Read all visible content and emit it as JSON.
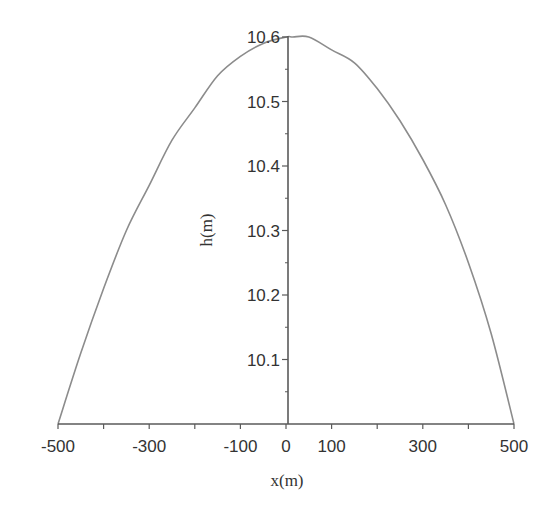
{
  "chart_data": {
    "type": "line",
    "title": "",
    "xlabel": "x(m)",
    "ylabel": "h(m)",
    "xlim": [
      -500,
      500
    ],
    "ylim": [
      10.0,
      10.6
    ],
    "grid": false,
    "legend": null,
    "x_ticks_major_labeled": [
      -500,
      -300,
      -100,
      0,
      100,
      300,
      500
    ],
    "x_tick_labels": [
      "-500",
      "-300",
      "-100",
      "0",
      "100",
      "300",
      "500"
    ],
    "x_ticks_all": [
      -500,
      -400,
      -300,
      -200,
      -100,
      0,
      100,
      200,
      300,
      400,
      500
    ],
    "y_ticks_major": [
      10.1,
      10.2,
      10.3,
      10.4,
      10.5,
      10.6
    ],
    "y_tick_labels": [
      "10.1",
      "10.2",
      "10.3",
      "10.4",
      "10.5",
      "10.6"
    ],
    "y_ticks_minor": [
      10.05,
      10.15,
      10.25,
      10.35,
      10.45,
      10.55
    ],
    "series": [
      {
        "name": "h(x)",
        "color": "#8c8c8c",
        "x": [
          -500,
          -450,
          -400,
          -350,
          -300,
          -250,
          -200,
          -150,
          -100,
          -50,
          0,
          15,
          50,
          100,
          150,
          200,
          250,
          300,
          350,
          400,
          450,
          500
        ],
        "y": [
          10.0,
          10.11,
          10.21,
          10.3,
          10.37,
          10.44,
          10.49,
          10.54,
          10.57,
          10.59,
          10.6,
          10.6,
          10.6,
          10.58,
          10.56,
          10.52,
          10.47,
          10.41,
          10.34,
          10.25,
          10.14,
          10.0
        ]
      }
    ],
    "annotations": []
  },
  "style": {
    "axis_color": "#5a5a5a",
    "curve_color": "#8c8c8c",
    "background": "#ffffff"
  }
}
